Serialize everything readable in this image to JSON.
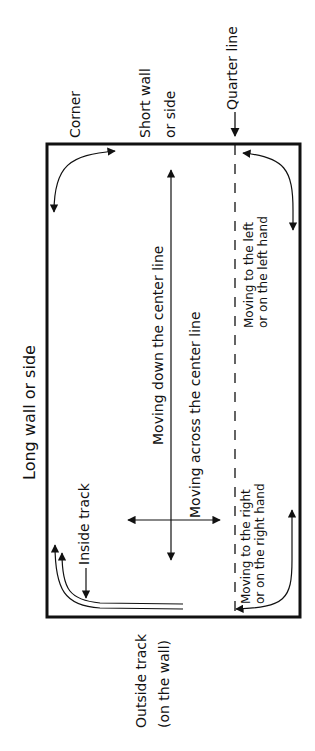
{
  "diagram": {
    "labels": {
      "long_wall": "Long wall or side",
      "corner": "Corner",
      "short_wall_1": "Short wall",
      "short_wall_2": "or side",
      "quarter_line": "Quarter line",
      "inside_track": "Inside track",
      "outside_track_1": "Outside track",
      "outside_track_2": "(on the wall)",
      "down_center": "Moving down the center line",
      "across_center": "Moving across the center line",
      "left_1": "Moving to the left",
      "left_2": "or on the left hand",
      "right_1": "Moving to the right",
      "right_2": "or on the right hand"
    },
    "colors": {
      "ink": "#111111",
      "background": "#ffffff"
    }
  }
}
